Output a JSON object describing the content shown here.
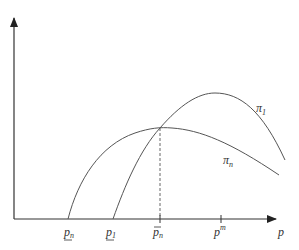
{
  "diagram": {
    "type": "profit-curves",
    "axes": {
      "x_label": "p",
      "y_label": ""
    },
    "curves": [
      {
        "name": "pi_n",
        "label_base": "π",
        "label_sub": "n"
      },
      {
        "name": "pi_1",
        "label_base": "π",
        "label_sub": "1"
      }
    ],
    "x_ticks": [
      {
        "id": "p_n_under",
        "base": "p",
        "sub": "n",
        "mark": "underline"
      },
      {
        "id": "p_1_under",
        "base": "p",
        "sub": "1",
        "mark": "underline"
      },
      {
        "id": "p_n_bar",
        "base": "p",
        "sub": "n",
        "mark": "overline"
      },
      {
        "id": "p_m",
        "base": "p",
        "sup": "m",
        "mark": "none"
      }
    ],
    "annotations": [
      {
        "type": "dashed-vertical",
        "at": "p_n_bar",
        "description": "intersection of π_1 and π_n"
      }
    ],
    "colors": {
      "axis": "#333333",
      "curve": "#555555",
      "background": "#ffffff"
    }
  }
}
